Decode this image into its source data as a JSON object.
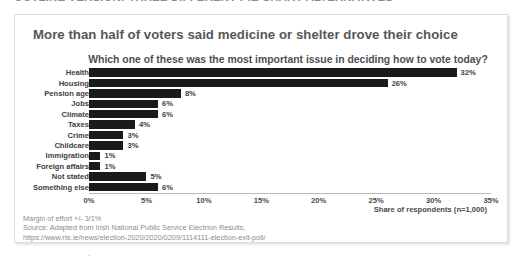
{
  "clipped_heading": "OUTLINE VERSION: THREE DIFFERENT PIE CHART ALTERNATIVES",
  "card": {
    "title": "More than half of voters said medicine or shelter drove their choice",
    "question": "Which one of these was the most important issue in deciding how to vote today?",
    "axis_caption": "Share of respondents (n=1,000)"
  },
  "footnotes": [
    "Margin of effort +/- 3/1%",
    "Source: Adapted from Irish National Public Service Electrion Results;",
    "https://www.rte.ie/news/election-2020/2020/0209/1114111-election-exit-poll/"
  ],
  "stray_mark": ".",
  "chart_data": {
    "type": "bar",
    "orientation": "horizontal",
    "title": "More than half of voters said medicine or shelter drove their choice",
    "subtitle": "Which one of these was the most important issue in deciding how to vote today?",
    "xlabel": "Share of respondents (n=1,000)",
    "ylabel": "",
    "xlim": [
      0,
      35
    ],
    "xtick_labels": [
      "0%",
      "5%",
      "10%",
      "15%",
      "20%",
      "25%",
      "30%",
      "35%"
    ],
    "xticks": [
      0,
      5,
      10,
      15,
      20,
      25,
      30,
      35
    ],
    "grid": false,
    "legend": false,
    "bar_color": "#1b1b1b",
    "categories": [
      "Health",
      "Housing",
      "Pension age",
      "Jobs",
      "Climate",
      "Taxes",
      "Crime",
      "Childcare",
      "Immigration",
      "Foreign affairs",
      "Not stated",
      "Something else"
    ],
    "values": [
      32,
      26,
      8,
      6,
      6,
      4,
      3,
      3,
      1,
      1,
      5,
      6
    ],
    "value_labels": [
      "32%",
      "26%",
      "8%",
      "6%",
      "6%",
      "4%",
      "3%",
      "3%",
      "1%",
      "1%",
      "5%",
      "6%"
    ]
  }
}
